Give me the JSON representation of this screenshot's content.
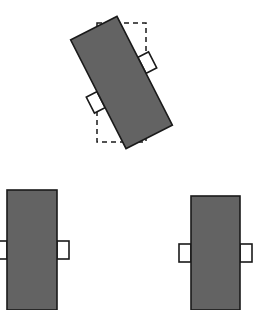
{
  "figure": {
    "title": "Rotated rectangular panel with axis-aligned bounding box",
    "canvas": {
      "width": 259,
      "height": 310,
      "background": "#ffffff"
    },
    "style": {
      "panel_fill": "#636363",
      "panel_stroke": "#1a1a1a",
      "panel_stroke_width": 1.6,
      "tab_fill": "#ffffff",
      "tab_stroke": "#1a1a1a",
      "tab_stroke_width": 1.6,
      "bbox_stroke": "#1a1a1a",
      "bbox_stroke_width": 1.5,
      "bbox_dash": "5,4"
    },
    "shapes": [
      {
        "id": "rotated-panel",
        "label": "Rotated panel",
        "rotation_deg": -27,
        "center": {
          "x": 121.5,
          "y": 82.5
        },
        "width": 52,
        "height": 122,
        "tabs": [
          {
            "side": "left",
            "offset_y": 6,
            "width": 12,
            "height": 18
          },
          {
            "side": "right",
            "offset_y": -6,
            "width": 12,
            "height": 18
          }
        ],
        "bounding_box": {
          "x": 97,
          "y": 23,
          "width": 49,
          "height": 119,
          "dashed": true
        }
      },
      {
        "id": "panel-bottom-left",
        "label": "Lower left panel",
        "rotation_deg": 0,
        "x": 7,
        "y": 190,
        "width": 50,
        "height": 120,
        "tabs": [
          {
            "side": "left",
            "offset_y": 0,
            "width": 12,
            "height": 18
          },
          {
            "side": "right",
            "offset_y": 0,
            "width": 12,
            "height": 18
          }
        ]
      },
      {
        "id": "panel-bottom-right",
        "label": "Lower right panel",
        "rotation_deg": 0,
        "x": 191,
        "y": 196,
        "width": 49,
        "height": 114,
        "tabs": [
          {
            "side": "left",
            "offset_y": 0,
            "width": 12,
            "height": 18
          },
          {
            "side": "right",
            "offset_y": 0,
            "width": 12,
            "height": 18
          }
        ]
      }
    ]
  }
}
